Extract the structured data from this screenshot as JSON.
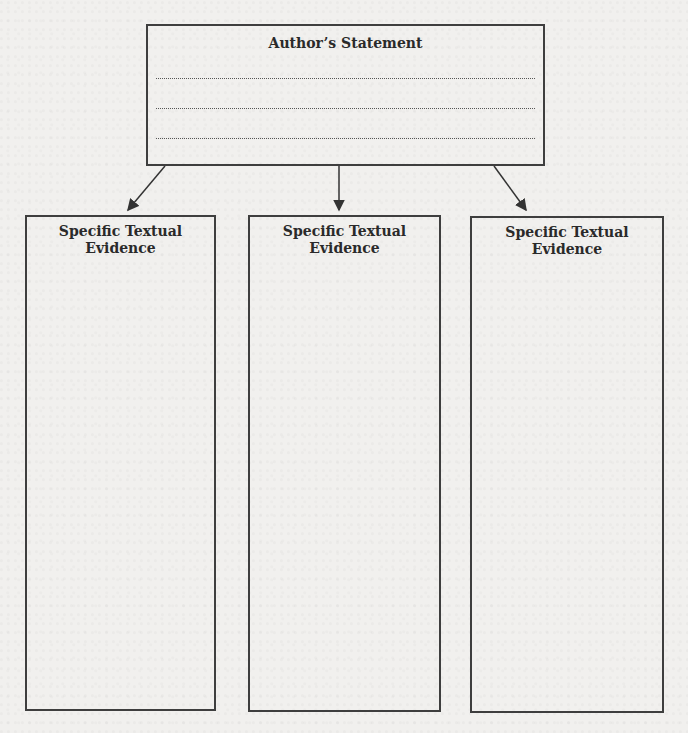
{
  "statement": {
    "title": "Author’s Statement",
    "lines": [
      "",
      "",
      ""
    ]
  },
  "evidence": [
    {
      "title_line1": "Specific Textual",
      "title_line2": "Evidence"
    },
    {
      "title_line1": "Specific Textual",
      "title_line2": "Evidence"
    },
    {
      "title_line1": "Specific Textual",
      "title_line2": "Evidence"
    }
  ],
  "colors": {
    "border": "#3e3e3e",
    "background": "#f1f0ee"
  }
}
